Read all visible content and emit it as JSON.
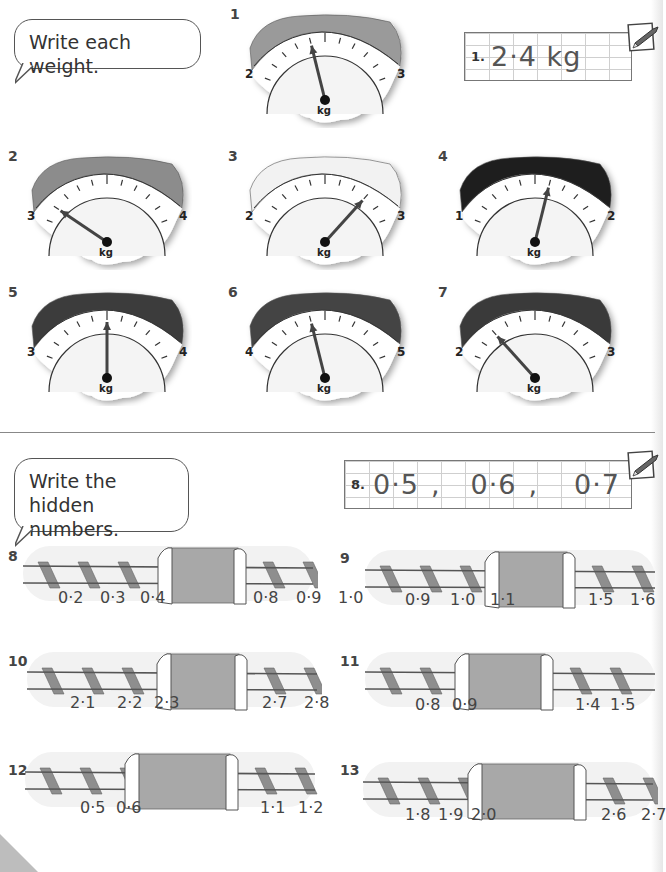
{
  "section1": {
    "instruction": "Write each weight.",
    "example": {
      "label": "1.",
      "answer": "2·4 kg"
    },
    "scales": [
      {
        "num": "1",
        "min_label": "2",
        "max_label": "3",
        "unit": "kg",
        "rim_color": "#9a9a9a",
        "reading": 2.4
      },
      {
        "num": "2",
        "min_label": "3",
        "max_label": "4",
        "unit": "kg",
        "rim_color": "#8c8c8c",
        "reading": 3.1
      },
      {
        "num": "3",
        "min_label": "2",
        "max_label": "3",
        "unit": "kg",
        "rim_color": "#f2f2f2",
        "reading": 2.8
      },
      {
        "num": "4",
        "min_label": "1",
        "max_label": "2",
        "unit": "kg",
        "rim_color": "#1e1e1e",
        "reading": 1.6
      },
      {
        "num": "5",
        "min_label": "3",
        "max_label": "4",
        "unit": "kg",
        "rim_color": "#3c3c3c",
        "reading": 3.5
      },
      {
        "num": "6",
        "min_label": "4",
        "max_label": "5",
        "unit": "kg",
        "rim_color": "#444444",
        "reading": 4.4
      },
      {
        "num": "7",
        "min_label": "2",
        "max_label": "3",
        "unit": "kg",
        "rim_color": "#3a3a3a",
        "reading": 2.2
      }
    ]
  },
  "section2": {
    "instruction": "Write the hidden numbers.",
    "example": {
      "label": "8.",
      "answers": [
        "0·5",
        ",",
        "0·6",
        ",",
        "0·7"
      ]
    },
    "tracks": [
      {
        "num": "8",
        "left": [
          "0·2",
          "0·3",
          "0·4"
        ],
        "right": [
          "0·8",
          "0·9",
          "1·0"
        ]
      },
      {
        "num": "9",
        "left": [
          "0·9",
          "1·0",
          "1·1"
        ],
        "right": [
          "1·5",
          "1·6"
        ]
      },
      {
        "num": "10",
        "left": [
          "2·1",
          "2·2",
          "2·3"
        ],
        "right": [
          "2·7",
          "2·8"
        ]
      },
      {
        "num": "11",
        "left": [
          "0·8",
          "0·9"
        ],
        "right": [
          "1·4",
          "1·5"
        ]
      },
      {
        "num": "12",
        "left": [
          "0·5",
          "0·6"
        ],
        "right": [
          "1·1",
          "1·2"
        ]
      },
      {
        "num": "13",
        "left": [
          "1·8",
          "1·9",
          "2·0"
        ],
        "right": [
          "2·6",
          "2·7"
        ]
      }
    ]
  },
  "icons": {
    "pencil": "pencil-icon"
  },
  "colors": {
    "tunnel": "#a8a8a8",
    "sleeper": "#8e8e8e",
    "rail": "#555555",
    "ground": "#f0f0f0"
  }
}
